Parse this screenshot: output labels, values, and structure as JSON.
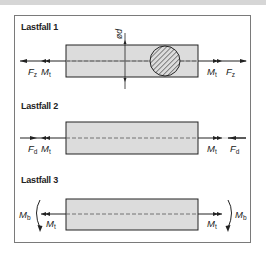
{
  "figure": {
    "colors": {
      "bar_fill": "#dcdcdc",
      "line": "#222222",
      "frame": "#7a7a7a",
      "top_strip": "#d6d6d6"
    },
    "cases": [
      {
        "label": "Lastfall 1",
        "left_force": {
          "symbol": "F",
          "sub": "z"
        },
        "left_moment": {
          "symbol": "M",
          "sub": "t"
        },
        "right_moment": {
          "symbol": "M",
          "sub": "t"
        },
        "right_force": {
          "symbol": "F",
          "sub": "z"
        },
        "section_label": "ød",
        "section_icon": "hatched-cross-section"
      },
      {
        "label": "Lastfall 2",
        "left_force": {
          "symbol": "F",
          "sub": "d"
        },
        "left_moment": {
          "symbol": "M",
          "sub": "t"
        },
        "right_moment": {
          "symbol": "M",
          "sub": "t"
        },
        "right_force": {
          "symbol": "F",
          "sub": "d"
        }
      },
      {
        "label": "Lastfall 3",
        "left_bending": {
          "symbol": "M",
          "sub": "b"
        },
        "left_moment": {
          "symbol": "M",
          "sub": "t"
        },
        "right_moment": {
          "symbol": "M",
          "sub": "t"
        },
        "right_bending": {
          "symbol": "M",
          "sub": "b"
        }
      }
    ]
  }
}
